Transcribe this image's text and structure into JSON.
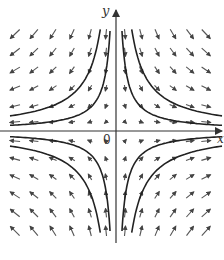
{
  "diagram": {
    "type": "direction_field",
    "system": {
      "dx_dt": "x",
      "dy_dt": "-y"
    },
    "labels": {
      "y_axis": "y",
      "x_axis": "x",
      "origin": "0"
    },
    "colors": {
      "arrow": "#555555",
      "curve": "#222222",
      "axis": "#333333",
      "background": "#ffffff"
    },
    "origin_px": [
      116,
      131
    ],
    "grid": {
      "columns_px": [
        15,
        34,
        53,
        72,
        90,
        106,
        125,
        141,
        157,
        173,
        190,
        206
      ],
      "rows_px": [
        34,
        52,
        70,
        88,
        106,
        122,
        141,
        159,
        177,
        195,
        213,
        231
      ]
    },
    "trajectories_xy_const": [
      600,
      1600
    ],
    "trajectory_count_per_quadrant": 2
  }
}
